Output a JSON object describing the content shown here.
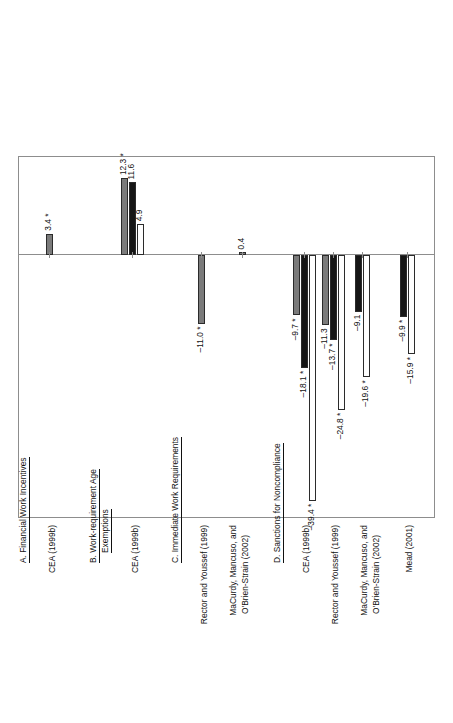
{
  "chart_data": {
    "type": "bar",
    "orientation": "vertical-bars-rotated-page",
    "title": "",
    "xlabel": "",
    "ylabel": "",
    "ylim": [
      -42,
      16
    ],
    "grid": false,
    "zero_line": 0,
    "legends": [
      {
        "name": "age-exemption-legend",
        "position": "upper-left",
        "entries": [
          {
            "label": "Child < 3",
            "color": "#7b7b7b",
            "swatch": "gray"
          },
          {
            "label": "Child < 6 mos.",
            "color": "#161616",
            "swatch": "black"
          },
          {
            "label": "No age exemption",
            "color": "#ffffff",
            "swatch": "white"
          }
        ]
      },
      {
        "name": "sanction-legend",
        "position": "upper-right",
        "entries": [
          {
            "label": "Lenient",
            "color": "#7b7b7b",
            "swatch": "gray"
          },
          {
            "label": "Eventual FF",
            "color": "#161616",
            "swatch": "black"
          },
          {
            "label": "Immediate FF",
            "color": "#ffffff",
            "swatch": "white"
          }
        ]
      }
    ],
    "sections": [
      {
        "id": "A",
        "label": "A. Financial Work Incentives",
        "groups": [
          {
            "category": "CEA (1999b)",
            "bars": [
              {
                "series": "single",
                "value": 3.4,
                "label": "3.4 *",
                "color": "gray"
              }
            ]
          }
        ]
      },
      {
        "id": "B",
        "label": "B. Work-requirement Age Exemptions",
        "label_line1": "B. Work-requirement Age",
        "label_line2": "Exemptions",
        "groups": [
          {
            "category": "CEA (1999b)",
            "bars": [
              {
                "series": "Child < 3",
                "value": 12.3,
                "label": "12.3 *",
                "color": "gray"
              },
              {
                "series": "Child < 6 mos.",
                "value": 11.6,
                "label": "11.6",
                "color": "black"
              },
              {
                "series": "No age exemption",
                "value": 4.9,
                "label": "4.9",
                "color": "white"
              }
            ]
          }
        ]
      },
      {
        "id": "C",
        "label": "C. Immediate Work Requirements",
        "groups": [
          {
            "category": "Rector and Youssef (1999)",
            "bars": [
              {
                "series": "single",
                "value": -11.0,
                "label": "–11.0 *",
                "color": "gray"
              }
            ]
          },
          {
            "category": "MaCurdy, Mancuso, and O'Brien-Strain (2002)",
            "category_line1": "MaCurdy, Mancuso, and",
            "category_line2": "O'Brien-Strain (2002)",
            "bars": [
              {
                "series": "single",
                "value": 0.4,
                "label": "0.4",
                "color": "gray"
              }
            ]
          }
        ]
      },
      {
        "id": "D",
        "label": "D. Sanctions for Noncompliance",
        "groups": [
          {
            "category": "CEA (1999b)",
            "bars": [
              {
                "series": "Lenient",
                "value": -9.7,
                "label": "–9.7 *",
                "color": "gray"
              },
              {
                "series": "Eventual FF",
                "value": -18.1,
                "label": "–18.1 *",
                "color": "black"
              },
              {
                "series": "Immediate FF",
                "value": -39.4,
                "label": "–39.4 *",
                "color": "white"
              }
            ]
          },
          {
            "category": "Rector and Youssef (1999)",
            "bars": [
              {
                "series": "Lenient",
                "value": -11.3,
                "label": "–11.3",
                "color": "gray"
              },
              {
                "series": "Eventual FF",
                "value": -13.7,
                "label": "–13.7 *",
                "color": "black"
              },
              {
                "series": "Immediate FF",
                "value": -24.8,
                "label": "–24.8 *",
                "color": "white"
              }
            ]
          },
          {
            "category": "MaCurdy, Mancuso, and O'Brien-Strain (2002)",
            "category_line1": "MaCurdy, Mancuso, and",
            "category_line2": "O'Brien-Strain (2002)",
            "bars": [
              {
                "series": "Eventual FF",
                "value": -9.1,
                "label": "–9.1",
                "color": "black"
              },
              {
                "series": "Immediate FF",
                "value": -19.6,
                "label": "–19.6 *",
                "color": "white"
              }
            ]
          },
          {
            "category": "Mead (2001)",
            "bars": [
              {
                "series": "Eventual FF",
                "value": -9.9,
                "label": "–9.9 *",
                "color": "black"
              },
              {
                "series": "Immediate FF",
                "value": -15.9,
                "label": "–15.9 *",
                "color": "white"
              }
            ]
          }
        ]
      }
    ]
  },
  "legend_age": {
    "rows": [
      {
        "label": "Child < 3"
      },
      {
        "label": "Child < 6 mos."
      },
      {
        "label": "No age exemption"
      }
    ]
  },
  "legend_sanction": {
    "rows": [
      {
        "label": "Lenient"
      },
      {
        "label": "Eventual FF"
      },
      {
        "label": "Immediate FF"
      }
    ]
  },
  "sections": {
    "a": "A. Financial Work Incentives",
    "b1": "B. Work-requirement Age",
    "b2": "Exemptions",
    "c": "C. Immediate Work Requirements",
    "d": "D. Sanctions for Noncompliance"
  },
  "categories": {
    "a1": "CEA (1999b)",
    "b1": "CEA (1999b)",
    "c1": "Rector and Youssef (1999)",
    "c2a": "MaCurdy, Mancuso, and",
    "c2b": "O'Brien-Strain (2002)",
    "d1": "CEA (1999b)",
    "d2": "Rector and Youssef (1999)",
    "d3a": "MaCurdy, Mancuso, and",
    "d3b": "O'Brien-Strain (2002)",
    "d4": "Mead (2001)"
  },
  "values": {
    "a1": "3.4 *",
    "b1_gray": "12.3 *",
    "b1_black": "11.6",
    "b1_white": "4.9",
    "c1": "–11.0 *",
    "c2": "0.4",
    "d1_gray": "–9.7 *",
    "d1_black": "–18.1 *",
    "d1_white": "–39.4 *",
    "d2_gray": "–11.3",
    "d2_black": "–13.7 *",
    "d2_white": "–24.8 *",
    "d3_black": "–9.1",
    "d3_white": "–19.6 *",
    "d4_black": "–9.9 *",
    "d4_white": "–15.9 *"
  }
}
